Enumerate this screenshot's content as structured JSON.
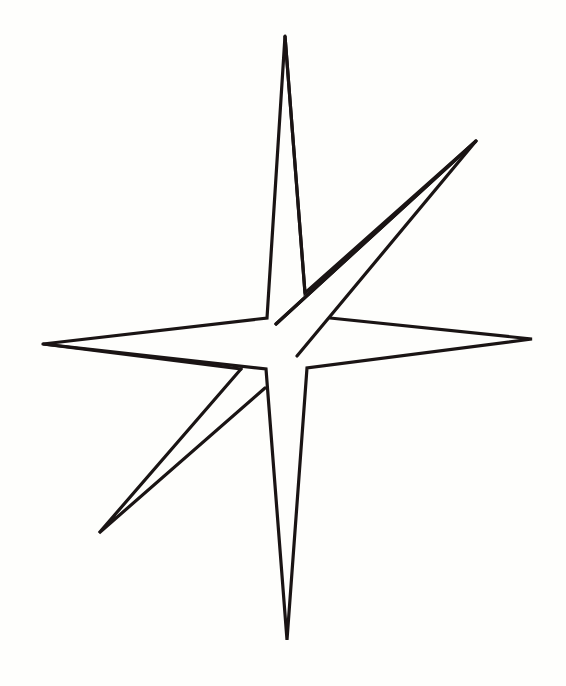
{
  "figure": {
    "stroke_color": "#1a1414",
    "fill_color": "#fefefc",
    "background_color": "#fefefc",
    "stroke_width": 3.2
  }
}
